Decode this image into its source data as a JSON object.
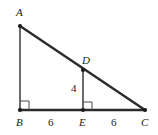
{
  "figure": {
    "background_color": "#ffffff",
    "stroke_color": "#2b2b2b",
    "canvas": {
      "width": 158,
      "height": 135
    },
    "vertices": [
      {
        "name": "A",
        "label": "A",
        "x": 20,
        "y": 26,
        "label_x": 16,
        "label_y": 7
      },
      {
        "name": "B",
        "label": "B",
        "x": 20,
        "y": 110,
        "label_x": 16,
        "label_y": 117
      },
      {
        "name": "C",
        "label": "C",
        "x": 145,
        "y": 110,
        "label_x": 141,
        "label_y": 117
      },
      {
        "name": "D",
        "label": "D",
        "x": 83,
        "y": 70,
        "label_x": 82,
        "label_y": 55
      },
      {
        "name": "E",
        "label": "E",
        "x": 83,
        "y": 110,
        "label_x": 79,
        "label_y": 117
      }
    ],
    "segments": [
      {
        "name": "AB",
        "from": "A",
        "to": "B",
        "width": 1.4
      },
      {
        "name": "BC",
        "from": "B",
        "to": "C",
        "width": 2.4
      },
      {
        "name": "AC",
        "from": "A",
        "to": "C",
        "width": 2.4
      },
      {
        "name": "DE",
        "from": "D",
        "to": "E",
        "width": 1.4
      }
    ],
    "right_angles": [
      {
        "name": "right-angle-B",
        "vertex": "B",
        "x": 20,
        "y": 110,
        "size": 9,
        "dir_x": 1,
        "dir_y": -1
      },
      {
        "name": "right-angle-E",
        "vertex": "E",
        "x": 83,
        "y": 110,
        "size": 9,
        "dir_x": 1,
        "dir_y": -1
      }
    ],
    "measures": [
      {
        "name": "BE-length",
        "label": "6",
        "x": 48,
        "y": 117
      },
      {
        "name": "EC-length",
        "label": "6",
        "x": 111,
        "y": 117
      },
      {
        "name": "DE-length",
        "label": "4",
        "x": 71,
        "y": 83
      }
    ]
  }
}
